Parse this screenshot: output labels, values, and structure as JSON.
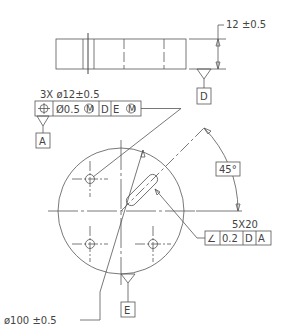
{
  "drawing": {
    "thickness_dim": "12 ±0.5",
    "datum_D": "D",
    "datum_A": "A",
    "datum_E": "E",
    "hole_callout": "3X  ø12±0.5",
    "position_fcf": {
      "symbol": "⌖",
      "tolerance": "Ø0.5",
      "modifier": "M",
      "datum1": "D",
      "datum2": "E",
      "datum2_modifier": "M"
    },
    "angle_dim": "45°",
    "slot_callout": "5X20",
    "angularity_fcf": {
      "symbol": "∠",
      "tolerance": "0.2",
      "datum1": "D",
      "datum2": "A"
    },
    "diameter_dim": "ø100 ±0.5"
  }
}
